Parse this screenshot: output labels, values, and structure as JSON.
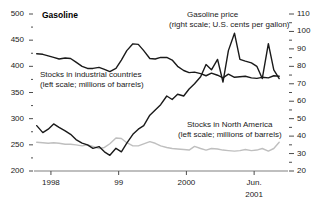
{
  "chart_data": {
    "type": "line",
    "title": "Gasoline",
    "xlabel": "",
    "ylabel": "",
    "grid": false,
    "legend_position": "inline-annotations",
    "axes": {
      "left": {
        "label": "millions of barrels",
        "ylim": [
          200,
          500
        ],
        "ticks": [
          200,
          250,
          300,
          350,
          400,
          450,
          500
        ],
        "tick_labels": [
          "200",
          "250",
          "300",
          "350",
          "400",
          "450",
          "500"
        ],
        "minor_tick_step": 25
      },
      "right": {
        "label": "U.S. cents per gallon",
        "ylim": [
          20,
          110
        ],
        "ticks": [
          20,
          30,
          40,
          50,
          60,
          70,
          80,
          90,
          100,
          110
        ],
        "tick_labels": [
          "20",
          "30",
          "40",
          "50",
          "60",
          "70",
          "80",
          "90",
          "100",
          "110"
        ],
        "minor_tick_step": 5
      },
      "x": {
        "ticks": [
          1998.0,
          1999.0,
          2000.0,
          2001.0
        ],
        "tick_labels": [
          "1998",
          "99",
          "2000",
          "Jun."
        ],
        "tick_label_second_line": [
          "",
          "",
          "",
          "2001"
        ],
        "xlim": [
          1997.75,
          2001.5
        ]
      }
    },
    "annotations": [
      {
        "name": "gasoline-price-annotation",
        "line1": "Gasoline price",
        "line2": "(right scale; U.S. cents per gallon)"
      },
      {
        "name": "industrial-stocks-annotation",
        "line1": "Stocks in industrial countries",
        "line2": "(left scale; millions of barrels)"
      },
      {
        "name": "north-america-stocks-annotation",
        "line1": "Stocks in North America",
        "line2": "(left scale; millions of barrels)"
      }
    ],
    "series": [
      {
        "name": "Stocks in industrial countries",
        "axis": "left",
        "color": "#1a1a1a",
        "width": 1.4,
        "x": [
          1997.79,
          1997.88,
          1997.96,
          1998.04,
          1998.12,
          1998.21,
          1998.29,
          1998.37,
          1998.46,
          1998.54,
          1998.62,
          1998.71,
          1998.79,
          1998.87,
          1998.96,
          1999.04,
          1999.12,
          1999.21,
          1999.29,
          1999.37,
          1999.46,
          1999.54,
          1999.62,
          1999.71,
          1999.79,
          1999.87,
          1999.96,
          2000.04,
          2000.12,
          2000.21,
          2000.29,
          2000.37,
          2000.46,
          2000.54,
          2000.62,
          2000.71,
          2000.79,
          2000.87,
          2000.96,
          2001.04,
          2001.12,
          2001.21,
          2001.29,
          2001.37
        ],
        "values": [
          424,
          423,
          420,
          417,
          414,
          416,
          415,
          408,
          400,
          396,
          396,
          398,
          394,
          390,
          396,
          412,
          430,
          443,
          442,
          430,
          415,
          414,
          417,
          417,
          412,
          400,
          392,
          388,
          389,
          386,
          382,
          387,
          383,
          378,
          385,
          379,
          380,
          381,
          378,
          377,
          379,
          378,
          382,
          381
        ]
      },
      {
        "name": "Stocks in North America",
        "axis": "left",
        "color": "#bfbfbf",
        "width": 1.4,
        "x": [
          1997.79,
          1997.88,
          1997.96,
          1998.04,
          1998.12,
          1998.21,
          1998.29,
          1998.37,
          1998.46,
          1998.54,
          1998.62,
          1998.71,
          1998.79,
          1998.87,
          1998.96,
          1999.04,
          1999.12,
          1999.21,
          1999.29,
          1999.37,
          1999.46,
          1999.54,
          1999.62,
          1999.71,
          1999.79,
          1999.87,
          1999.96,
          2000.04,
          2000.12,
          2000.21,
          2000.29,
          2000.37,
          2000.46,
          2000.54,
          2000.62,
          2000.71,
          2000.79,
          2000.87,
          2000.96,
          2001.04,
          2001.12,
          2001.21,
          2001.29,
          2001.37
        ],
        "values": [
          255,
          254,
          253,
          254,
          253,
          251,
          251,
          250,
          248,
          250,
          247,
          243,
          245,
          252,
          263,
          262,
          254,
          248,
          248,
          252,
          256,
          253,
          248,
          245,
          243,
          242,
          241,
          240,
          247,
          243,
          240,
          243,
          242,
          240,
          239,
          238,
          239,
          241,
          239,
          240,
          243,
          238,
          243,
          255
        ]
      },
      {
        "name": "Gasoline price",
        "axis": "right",
        "color": "#1a1a1a",
        "width": 1.4,
        "x": [
          1997.79,
          1997.88,
          1997.96,
          1998.04,
          1998.12,
          1998.21,
          1998.29,
          1998.37,
          1998.46,
          1998.54,
          1998.62,
          1998.71,
          1998.79,
          1998.87,
          1998.96,
          1999.04,
          1999.12,
          1999.21,
          1999.29,
          1999.37,
          1999.46,
          1999.54,
          1999.62,
          1999.71,
          1999.79,
          1999.87,
          1999.96,
          2000.04,
          2000.12,
          2000.21,
          2000.29,
          2000.37,
          2000.46,
          2000.54,
          2000.62,
          2000.71,
          2000.79,
          2000.87,
          2000.96,
          2001.04,
          2001.12,
          2001.21,
          2001.29,
          2001.37
        ],
        "values": [
          46,
          42,
          44,
          47,
          45,
          43,
          41,
          38,
          36,
          35,
          33,
          34,
          31,
          29,
          33,
          31,
          36,
          41,
          44,
          46,
          52,
          55,
          58,
          63,
          61,
          64,
          63,
          67,
          70,
          74,
          81,
          78,
          84,
          71,
          89,
          99,
          84,
          83,
          82,
          80,
          73,
          93,
          78,
          73
        ]
      }
    ]
  }
}
